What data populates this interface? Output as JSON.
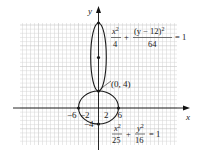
{
  "chart_data": {
    "type": "diagram",
    "title": "",
    "xlabel": "x",
    "ylabel": "y",
    "x_tick_labels": [
      "-6",
      "-2",
      "2",
      "6"
    ],
    "x_tick_values": [
      -6,
      -2,
      2,
      6
    ],
    "grid": true,
    "xlim": [
      -20,
      20
    ],
    "ylim": [
      -9,
      20
    ],
    "curves": [
      {
        "name": "upper-ellipse",
        "equation": "x^2/4 + (y-12)^2/64 = 1",
        "center": [
          0,
          12
        ],
        "semi_axis_x": 2,
        "semi_axis_y": 8
      },
      {
        "name": "lower-ellipse",
        "equation": "x^2/25 + y^2/16 = 1",
        "center": [
          0,
          0
        ],
        "semi_axis_x": 5,
        "semi_axis_y": 4
      }
    ],
    "points": [
      {
        "x": 0,
        "y": 20
      },
      {
        "x": 0,
        "y": 12
      },
      {
        "x": 0,
        "y": 4
      },
      {
        "x": -5,
        "y": 0
      },
      {
        "x": 5,
        "y": 0
      },
      {
        "x": 0,
        "y": -4
      }
    ],
    "annotations": [
      {
        "text": "(0, 4)",
        "at": [
          0,
          4
        ]
      },
      {
        "text": "-4",
        "at": [
          0,
          -4
        ]
      }
    ]
  },
  "labels": {
    "x_axis": "x",
    "y_axis": "y",
    "tick_neg6": "−6",
    "tick_neg2": "−2",
    "tick_2": "2",
    "tick_6": "6",
    "tick_neg4": "−4",
    "point_0_4": "(0, 4)"
  },
  "equations": {
    "upper": {
      "num1_var": "x",
      "num1_exp": "2",
      "den1": "4",
      "plus": "+",
      "num2_pre": "(y − 12)",
      "num2_exp": "2",
      "den2": "64",
      "equals": "= 1"
    },
    "lower": {
      "num1_var": "x",
      "num1_exp": "2",
      "den1": "25",
      "plus": "+",
      "num2_var": "y",
      "num2_exp": "2",
      "den2": "16",
      "equals": "= 1"
    }
  }
}
